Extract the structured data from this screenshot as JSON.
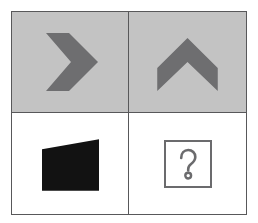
{
  "puzzle": {
    "title": "Visual analogy matrix",
    "type": "2x2 matrix reasoning item",
    "rows": 2,
    "columns": 2,
    "cells": [
      {
        "position": "top-left",
        "background_color": "#c3c3c3",
        "figure": "chevron-right",
        "figure_label": "Right-pointing chevron",
        "figure_color": "#6e6e70",
        "rotation_degrees": 0
      },
      {
        "position": "top-right",
        "background_color": "#c3c3c3",
        "figure": "chevron-up",
        "figure_label": "Up-pointing chevron",
        "figure_color": "#6e6e70",
        "rotation_degrees": -90
      },
      {
        "position": "bottom-left",
        "background_color": "#ffffff",
        "figure": "black-quadrilateral",
        "figure_label": "Black quadrilateral with slanted top edge",
        "figure_color": "#121212",
        "rotation_degrees": 0
      },
      {
        "position": "bottom-right",
        "background_color": "#ffffff",
        "figure": "question-mark-box",
        "figure_label": "Question mark in square outline",
        "figure_color": "#6b6b6d",
        "answer_placeholder": "?"
      }
    ]
  },
  "colors": {
    "frame_border": "#58585a",
    "cell_gray": "#c3c3c3",
    "cell_white": "#ffffff",
    "chevron_gray": "#6e6e70",
    "quadrilateral_black": "#121212",
    "question_outline": "#6b6b6d",
    "page_background": "#ffffff"
  }
}
